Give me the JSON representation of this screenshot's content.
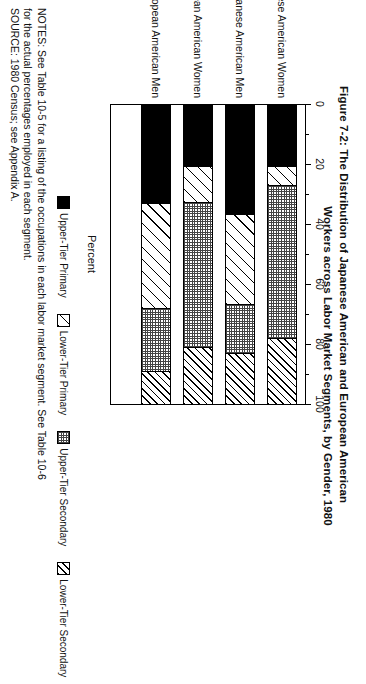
{
  "figure": {
    "title_line1": "Figure 7-2:  The Distribution of Japanese American and European American",
    "title_line2": "Workers across Labor Market Segments, by Gender, 1980"
  },
  "axis": {
    "x_title": "Percent",
    "ticks": [
      "0",
      "20",
      "40",
      "60",
      "80",
      "100"
    ],
    "tick_values": [
      0,
      20,
      40,
      60,
      80,
      100
    ],
    "minor_tick_values": [
      10,
      30,
      50,
      70,
      90
    ]
  },
  "legend": {
    "items": [
      {
        "label": "Upper-Tier Primary",
        "pattern": "solid-black",
        "color": "#000000"
      },
      {
        "label": "Lower-Tier Primary",
        "pattern": "wide-diagonal",
        "color": "#ffffff"
      },
      {
        "label": "Upper-Tier Secondary",
        "pattern": "dotted-gray",
        "color": "#808080"
      },
      {
        "label": "Lower-Tier Secondary",
        "pattern": "narrow-diagonal",
        "color": "#ffffff"
      }
    ]
  },
  "notes": {
    "line1": "NOTES:   See Table 10-5 for a listing of the occupations in each labor market segment.  See Table 10-6",
    "line2": "for the actual percentages employed in each segment.",
    "line3": "SOURCE:  1980 Census; see Appendix A."
  },
  "chart_data": {
    "type": "bar",
    "orientation": "stacked-horizontal",
    "title": "Figure 7-2:  The Distribution of Japanese American and European American Workers across Labor Market Segments, by Gender, 1980",
    "xlabel": "Percent",
    "ylabel": "",
    "xlim": [
      0,
      100
    ],
    "grid": false,
    "legend_position": "bottom",
    "categories": [
      "Japanese American Women",
      "Japanese American Men",
      "European American Women",
      "European American Men"
    ],
    "series": [
      {
        "name": "Upper-Tier Primary",
        "values": [
          20.5,
          36.5,
          20.5,
          33.0
        ]
      },
      {
        "name": "Lower-Tier Primary",
        "values": [
          6.5,
          30.0,
          12.0,
          35.0
        ]
      },
      {
        "name": "Upper-Tier Secondary",
        "values": [
          51.0,
          16.5,
          48.5,
          21.0
        ]
      },
      {
        "name": "Lower-Tier Secondary",
        "values": [
          22.0,
          17.0,
          19.0,
          11.0
        ]
      }
    ]
  }
}
